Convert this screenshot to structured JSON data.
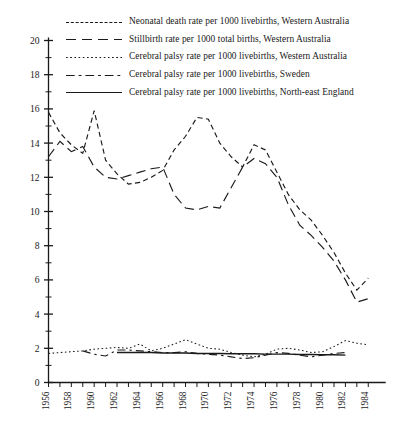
{
  "chart_data": {
    "type": "line",
    "title": "",
    "xlabel": "",
    "ylabel": "",
    "xlim": [
      1956,
      1985
    ],
    "ylim": [
      0,
      20
    ],
    "y_ticks_major": [
      0,
      2,
      4,
      6,
      8,
      10,
      12,
      14,
      16,
      18,
      20
    ],
    "y_ticks_minor": [
      1,
      3,
      5,
      7,
      9,
      11,
      13,
      15,
      17,
      19
    ],
    "x_tick_labels": [
      "1956",
      "1958",
      "1960",
      "1962",
      "1964",
      "1966",
      "1968",
      "1970",
      "1972",
      "1974",
      "1976",
      "1978",
      "1980",
      "1982",
      "1984"
    ],
    "x_all_years": [
      1956,
      1957,
      1958,
      1959,
      1960,
      1961,
      1962,
      1963,
      1964,
      1965,
      1966,
      1967,
      1968,
      1969,
      1970,
      1971,
      1972,
      1973,
      1974,
      1975,
      1976,
      1977,
      1978,
      1979,
      1980,
      1981,
      1982,
      1983,
      1984
    ],
    "grid": false,
    "legend_position": "top",
    "series": [
      {
        "name": "Neonatal death rate per 1000 livebirths, Western Australia",
        "style": "short-dash",
        "x": [
          1956,
          1957,
          1958,
          1959,
          1960,
          1961,
          1962,
          1963,
          1964,
          1965,
          1966,
          1967,
          1968,
          1969,
          1970,
          1971,
          1972,
          1973,
          1974,
          1975,
          1976,
          1977,
          1978,
          1979,
          1980,
          1981,
          1982,
          1983,
          1984
        ],
        "values": [
          15.8,
          14.6,
          13.9,
          13.4,
          15.9,
          13.0,
          12.2,
          11.6,
          11.7,
          12.0,
          12.4,
          13.6,
          14.4,
          15.5,
          15.4,
          14.0,
          13.2,
          12.6,
          13.9,
          13.6,
          12.3,
          11.0,
          10.1,
          9.5,
          8.6,
          7.6,
          6.4,
          5.4,
          6.1
        ]
      },
      {
        "name": "Stillbirth rate per 1000 total births, Western Australia",
        "style": "long-dash",
        "x": [
          1956,
          1957,
          1958,
          1959,
          1960,
          1961,
          1962,
          1963,
          1964,
          1965,
          1966,
          1967,
          1968,
          1969,
          1970,
          1971,
          1972,
          1973,
          1974,
          1975,
          1976,
          1977,
          1978,
          1979,
          1980,
          1981,
          1982,
          1983,
          1984
        ],
        "values": [
          13.2,
          14.1,
          13.5,
          13.8,
          12.6,
          12.0,
          11.9,
          12.1,
          12.3,
          12.5,
          12.6,
          11.0,
          10.2,
          10.1,
          10.3,
          10.2,
          11.4,
          12.6,
          13.1,
          12.8,
          12.0,
          10.4,
          9.2,
          8.6,
          7.9,
          7.1,
          6.0,
          4.7,
          4.9
        ]
      },
      {
        "name": "Cerebral palsy rate per 1000 livebirths, Western Australia",
        "style": "dotted",
        "x": [
          1956,
          1957,
          1958,
          1959,
          1960,
          1961,
          1962,
          1963,
          1964,
          1965,
          1966,
          1967,
          1968,
          1969,
          1970,
          1971,
          1972,
          1973,
          1974,
          1975,
          1976,
          1977,
          1978,
          1979,
          1980,
          1981,
          1982,
          1983,
          1984
        ],
        "values": [
          1.7,
          1.75,
          1.8,
          1.85,
          1.95,
          2.0,
          2.05,
          2.0,
          2.25,
          1.85,
          2.0,
          2.25,
          2.5,
          2.25,
          2.0,
          1.95,
          1.75,
          1.6,
          1.5,
          1.65,
          1.95,
          2.0,
          1.9,
          1.75,
          1.8,
          2.1,
          2.45,
          2.3,
          2.2
        ]
      },
      {
        "name": "Cerebral palsy rate per 1000 livebirths, Sweden",
        "style": "dash-dot",
        "x": [
          1959,
          1960,
          1961,
          1962,
          1963,
          1964,
          1965,
          1966,
          1967,
          1968,
          1969,
          1970,
          1971,
          1972,
          1973,
          1974,
          1975,
          1976,
          1977,
          1978,
          1979,
          1980,
          1981,
          1982
        ],
        "values": [
          1.85,
          1.65,
          1.55,
          1.9,
          1.9,
          1.85,
          1.8,
          1.75,
          1.75,
          1.8,
          1.7,
          1.65,
          1.6,
          1.5,
          1.4,
          1.45,
          1.6,
          1.75,
          1.7,
          1.6,
          1.5,
          1.6,
          1.7,
          1.75
        ]
      },
      {
        "name": "Cerebral palsy rate per 1000 livebirths, North-east England",
        "style": "solid",
        "x": [
          1962,
          1963,
          1964,
          1965,
          1966,
          1967,
          1968,
          1969,
          1970,
          1971,
          1972,
          1973,
          1974,
          1975,
          1976,
          1977,
          1978,
          1979,
          1980,
          1981,
          1982
        ],
        "values": [
          1.75,
          1.75,
          1.75,
          1.75,
          1.72,
          1.72,
          1.72,
          1.7,
          1.7,
          1.7,
          1.68,
          1.68,
          1.68,
          1.66,
          1.66,
          1.66,
          1.64,
          1.64,
          1.62,
          1.62,
          1.6
        ]
      }
    ]
  },
  "legend": {
    "items": [
      {
        "label": "Neonatal death rate per 1000 livebirths, Western Australia",
        "style": "short-dash"
      },
      {
        "label": "Stillbirth rate per 1000 total births, Western Australia",
        "style": "long-dash"
      },
      {
        "label": "Cerebral palsy rate per 1000 livebirths, Western Australia",
        "style": "dotted"
      },
      {
        "label": "Cerebral palsy rate per 1000 livebirths, Sweden",
        "style": "dash-dot"
      },
      {
        "label": "Cerebral palsy rate per 1000 livebirths, North-east England",
        "style": "solid"
      }
    ]
  },
  "colors": {
    "ink": "#1a1a1a",
    "background": "#ffffff"
  }
}
